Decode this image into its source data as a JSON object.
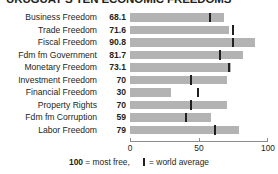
{
  "chart_data": {
    "type": "bar",
    "title": "URUGUAY'S TEN ECONOMIC FREEDOMS",
    "orientation": "horizontal",
    "xlabel": "",
    "ylabel": "",
    "xlim": [
      0,
      100
    ],
    "grid": false,
    "axis_ticks": [
      {
        "value": 0,
        "label": "0"
      },
      {
        "value": 50,
        "label": "50"
      },
      {
        "value": 100,
        "label": "100"
      }
    ],
    "categories": [
      "Business Freedom",
      "Trade Freedom",
      "Fiscal Freedom",
      "Fdm fm Government",
      "Monetary Freedom",
      "Investment Freedom",
      "Financial Freedom",
      "Property Rights",
      "Fdm fm Corruption",
      "Labor Freedom"
    ],
    "values": [
      68.1,
      71.6,
      90.8,
      81.7,
      73.1,
      70,
      30,
      70,
      59,
      79
    ],
    "value_labels": [
      "68.1",
      "71.6",
      "90.8",
      "81.7",
      "73.1",
      "70",
      "30",
      "70",
      "59",
      "79"
    ],
    "world_average": [
      58.0,
      74.5,
      74.8,
      65.0,
      71.9,
      44.4,
      49.0,
      44.0,
      40.5,
      61.5
    ],
    "series": [
      {
        "name": "Uruguay score",
        "values": [
          68.1,
          71.6,
          90.8,
          81.7,
          73.1,
          70,
          30,
          70,
          59,
          79
        ]
      },
      {
        "name": "World average",
        "values": [
          58.0,
          74.5,
          74.8,
          65.0,
          71.9,
          44.4,
          49.0,
          44.0,
          40.5,
          61.5
        ]
      }
    ],
    "legend": {
      "position": "bottom",
      "max_label": "100",
      "max_text": " = most free,",
      "average_text": " = world average"
    },
    "colors": {
      "bar": "#b3b3b3",
      "tick": "#231f20",
      "text": "#231f20",
      "axis": "#8c8c8c"
    }
  }
}
